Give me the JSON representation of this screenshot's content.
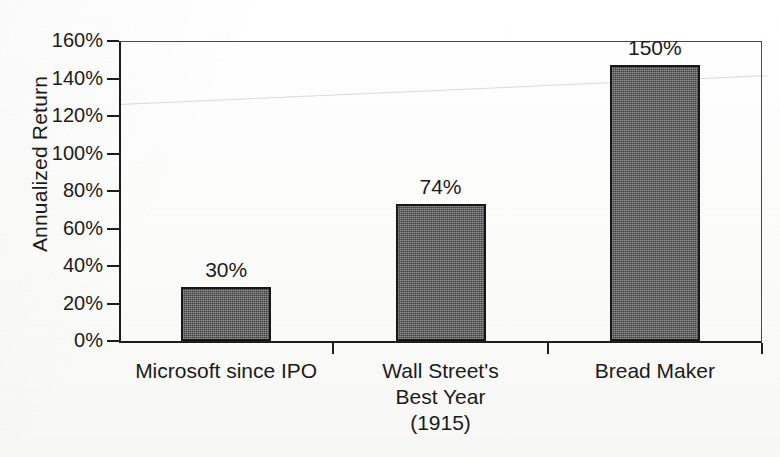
{
  "chart_data": {
    "type": "bar",
    "title": "",
    "xlabel": "",
    "ylabel": "Annualized Return",
    "ylim": [
      0,
      160
    ],
    "ytick_suffix": "%",
    "grid": false,
    "legend": false,
    "categories": [
      "Microsoft since IPO",
      "Wall Street's\nBest Year\n(1915)",
      "Bread Maker"
    ],
    "values": [
      30,
      74,
      150
    ],
    "value_labels": [
      "30%",
      "74%",
      "150%"
    ],
    "ytick_labels": [
      "0%",
      "20%",
      "40%",
      "60%",
      "80%",
      "100%",
      "120%",
      "140%",
      "160%"
    ],
    "ytick_values": [
      0,
      20,
      40,
      60,
      80,
      100,
      120,
      140,
      160
    ],
    "bar_fill_color": "#5b5b5b",
    "bar_edge_color": "#171717",
    "axis_color": "#1d1d1d",
    "background_color": "#fcfcfb"
  },
  "axis": {
    "y_title": "Annualized Return"
  },
  "ticks": {
    "y": [
      {
        "label": "160%",
        "value": 160
      },
      {
        "label": "140%",
        "value": 140
      },
      {
        "label": "120%",
        "value": 120
      },
      {
        "label": "100%",
        "value": 100
      },
      {
        "label": "80%",
        "value": 80
      },
      {
        "label": "60%",
        "value": 60
      },
      {
        "label": "40%",
        "value": 40
      },
      {
        "label": "20%",
        "value": 20
      },
      {
        "label": "0%",
        "value": 0
      }
    ]
  },
  "bars": [
    {
      "label": "Microsoft since IPO",
      "value_label": "30%",
      "value": 30
    },
    {
      "label": "Wall Street's\nBest Year\n(1915)",
      "value_label": "74%",
      "value": 74
    },
    {
      "label": "Bread Maker",
      "value_label": "150%",
      "value": 150
    }
  ]
}
